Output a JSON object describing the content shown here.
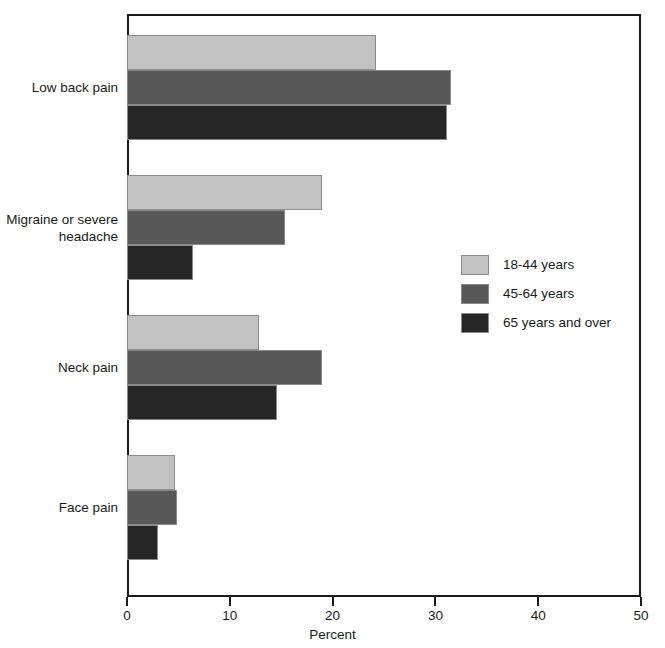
{
  "chart_data": {
    "type": "bar",
    "orientation": "horizontal",
    "title": "",
    "subtitle": "",
    "xlabel": "Percent",
    "ylabel": "",
    "xlim": [
      0,
      50
    ],
    "xticks": [
      0,
      10,
      20,
      30,
      40,
      50
    ],
    "xtick_labels": [
      "0",
      "10",
      "20",
      "30",
      "40",
      "50"
    ],
    "grid": false,
    "legend_position": "center-right",
    "categories": [
      "Low back pain",
      "Migraine or severe\nheadache",
      "Neck pain",
      "Face pain"
    ],
    "series": [
      {
        "name": "18-44 years",
        "color": "#c2c2c2",
        "values": [
          24.2,
          19.0,
          12.8,
          4.7
        ]
      },
      {
        "name": "45-64 years",
        "color": "#585858",
        "values": [
          31.5,
          15.4,
          19.0,
          4.9
        ]
      },
      {
        "name": "65 years and over",
        "color": "#262626",
        "values": [
          31.1,
          6.4,
          14.6,
          3.0
        ]
      }
    ]
  },
  "axis": {
    "x_title": "Percent",
    "ticks": [
      "0",
      "10",
      "20",
      "30",
      "40",
      "50"
    ]
  },
  "categories": [
    {
      "label": "Low back pain"
    },
    {
      "label": "Migraine or severe\nheadache"
    },
    {
      "label": "Neck pain"
    },
    {
      "label": "Face pain"
    }
  ],
  "legend": {
    "items": [
      {
        "label": "18-44 years",
        "color": "#c2c2c2"
      },
      {
        "label": "45-64 years",
        "color": "#585858"
      },
      {
        "label": "65 years and over",
        "color": "#262626"
      }
    ]
  },
  "colors": {
    "series_light": "#c2c2c2",
    "series_mid": "#585858",
    "series_dark": "#262626",
    "axis": "#1a1a1a",
    "background": "#ffffff"
  }
}
